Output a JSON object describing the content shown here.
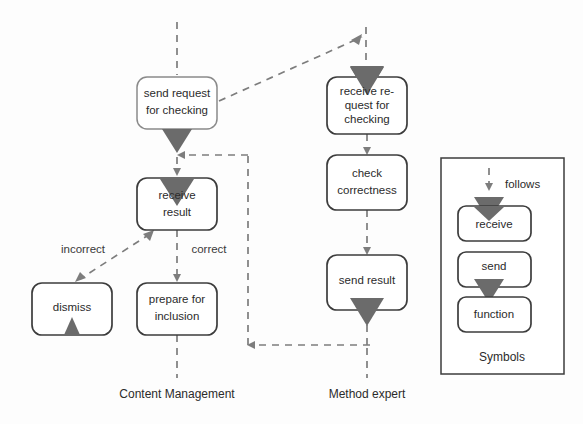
{
  "diagram": {
    "colors": {
      "box_stroke": "#3c3c3c",
      "box_stroke_light": "#8a8a8a",
      "triangle_fill": "#6b6b6b",
      "flow_stroke": "#7d7d7d",
      "text": "#2b2b2b",
      "background": "#fdfdfd"
    },
    "lanes": [
      {
        "id": "content-management",
        "label": "Content Management"
      },
      {
        "id": "method-expert",
        "label": "Method expert"
      }
    ],
    "nodes": [
      {
        "id": "send-request-for-checking",
        "lane": "content-management",
        "lines": [
          "send request",
          "for checking"
        ],
        "symbol": "send",
        "x": 137,
        "y": 77,
        "w": 80,
        "h": 52
      },
      {
        "id": "receive-result",
        "lane": "content-management",
        "lines": [
          "receive",
          "result"
        ],
        "symbol": "receive",
        "x": 137,
        "y": 178,
        "w": 80,
        "h": 52
      },
      {
        "id": "dismiss",
        "lane": "content-management",
        "lines": [
          "dismiss"
        ],
        "symbol": "send-small",
        "x": 32,
        "y": 283,
        "w": 80,
        "h": 52
      },
      {
        "id": "prepare-for-inclusion",
        "lane": "content-management",
        "lines": [
          "prepare for",
          "inclusion"
        ],
        "symbol": "function",
        "x": 137,
        "y": 283,
        "w": 80,
        "h": 52
      },
      {
        "id": "receive-request-for-checking",
        "lane": "method-expert",
        "lines": [
          "receive re-",
          "quest for",
          "checking"
        ],
        "symbol": "receive",
        "x": 327,
        "y": 77,
        "w": 80,
        "h": 57
      },
      {
        "id": "check-correctness",
        "lane": "method-expert",
        "lines": [
          "check",
          "correctness"
        ],
        "symbol": "function",
        "x": 327,
        "y": 155,
        "w": 80,
        "h": 55
      },
      {
        "id": "send-result",
        "lane": "method-expert",
        "lines": [
          "send result"
        ],
        "symbol": "send",
        "x": 327,
        "y": 255,
        "w": 80,
        "h": 55
      }
    ],
    "edges": [
      {
        "id": "start-into-send-request",
        "label": ""
      },
      {
        "id": "send-request-to-receive-request",
        "label": ""
      },
      {
        "id": "send-request-to-receive-result",
        "label": ""
      },
      {
        "id": "receive-request-to-check",
        "label": ""
      },
      {
        "id": "check-to-send-result",
        "label": ""
      },
      {
        "id": "send-result-to-receive-result",
        "label": ""
      },
      {
        "id": "receive-result-to-dismiss",
        "label": "incorrect"
      },
      {
        "id": "receive-result-to-prepare",
        "label": "correct"
      },
      {
        "id": "prepare-to-end",
        "label": ""
      },
      {
        "id": "send-result-to-end",
        "label": ""
      }
    ],
    "edge_labels": {
      "incorrect": "incorrect",
      "correct": "correct"
    },
    "legend": {
      "title": "Symbols",
      "follows_label": "follows",
      "items": [
        {
          "id": "legend-receive",
          "label": "receive",
          "symbol": "receive"
        },
        {
          "id": "legend-send",
          "label": "send",
          "symbol": "send"
        },
        {
          "id": "legend-function",
          "label": "function",
          "symbol": "function"
        }
      ]
    }
  }
}
